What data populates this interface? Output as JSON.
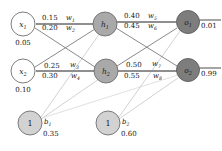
{
  "diagram": {
    "colors": {
      "input_fill": "#ffffff",
      "hidden_fill": "#a9a9a9",
      "output_fill": "#7d7d7d",
      "bias_fill": "#d2d2d2",
      "node_stroke": "#666666",
      "edge_color": "#6b6b6b",
      "bias_edge_color": "#b9b9b9",
      "thick_edge_color": "#8a8a8a",
      "text_color": "#151515"
    },
    "nodes": {
      "inputs": [
        {
          "id": "x1",
          "label": "x",
          "sub": "1",
          "value": "0.05"
        },
        {
          "id": "x2",
          "label": "x",
          "sub": "2",
          "value": "0.10"
        }
      ],
      "hidden": [
        {
          "id": "h1",
          "label": "h",
          "sub": "1"
        },
        {
          "id": "h2",
          "label": "h",
          "sub": "2"
        }
      ],
      "outputs": [
        {
          "id": "o1",
          "label": "o",
          "sub": "1",
          "value": "0.01"
        },
        {
          "id": "o2",
          "label": "o",
          "sub": "2",
          "value": "0.99"
        }
      ],
      "biases": [
        {
          "id": "b1",
          "node_label": "1",
          "label": "b",
          "sub": "1",
          "value": "0.35"
        },
        {
          "id": "b2",
          "node_label": "1",
          "label": "b",
          "sub": "2",
          "value": "0.60"
        }
      ]
    },
    "weights": [
      {
        "id": "w1",
        "value": "0.15",
        "sym": "w",
        "sub": "1"
      },
      {
        "id": "w2",
        "value": "0.20",
        "sym": "w",
        "sub": "2"
      },
      {
        "id": "w3",
        "value": "0.25",
        "sym": "w",
        "sub": "3"
      },
      {
        "id": "w4",
        "value": "0.30",
        "sym": "w",
        "sub": "4"
      },
      {
        "id": "w5",
        "value": "0.40",
        "sym": "w",
        "sub": "5"
      },
      {
        "id": "w6",
        "value": "0.45",
        "sym": "w",
        "sub": "6"
      },
      {
        "id": "w7",
        "value": "0.50",
        "sym": "w",
        "sub": "7"
      },
      {
        "id": "w8",
        "value": "0.55",
        "sym": "w",
        "sub": "8"
      }
    ]
  }
}
